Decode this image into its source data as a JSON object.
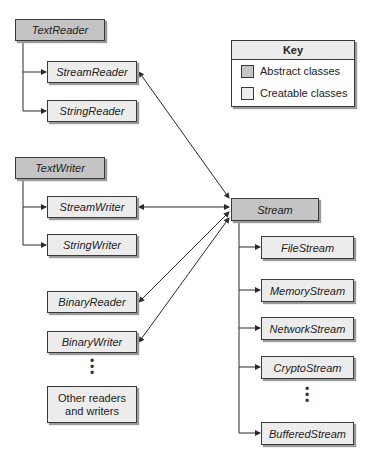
{
  "key": {
    "title": "Key",
    "items": [
      {
        "label": "Abstract classes",
        "color": "#c4c4c4"
      },
      {
        "label": "Creatable classes",
        "color": "#ececec"
      }
    ]
  },
  "readers": {
    "base": "TextReader",
    "children": [
      "StreamReader",
      "StringReader"
    ]
  },
  "writers": {
    "base": "TextWriter",
    "children": [
      "StreamWriter",
      "StringWriter"
    ]
  },
  "binary": {
    "items": [
      "BinaryReader",
      "BinaryWriter"
    ],
    "ellipsis": "⋮",
    "other": "Other readers and writers"
  },
  "streams": {
    "base": "Stream",
    "children": [
      "FileStream",
      "MemoryStream",
      "NetworkStream",
      "CryptoStream",
      "BufferedStream"
    ],
    "ellipsis": "⋮"
  },
  "colors": {
    "abstract": "#c4c4c4",
    "creatable": "#ececec",
    "line": "#2a2a2a"
  }
}
